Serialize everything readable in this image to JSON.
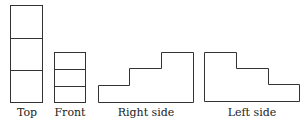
{
  "diagram": {
    "stroke_color": "#333333",
    "views": [
      {
        "id": "top",
        "label": "Top"
      },
      {
        "id": "front",
        "label": "Front"
      },
      {
        "id": "right",
        "label": "Right side"
      },
      {
        "id": "left",
        "label": "Left side"
      }
    ]
  }
}
